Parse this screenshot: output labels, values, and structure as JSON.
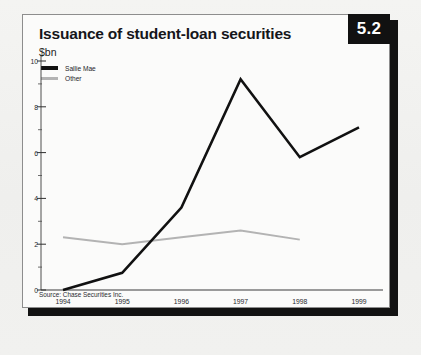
{
  "figure": {
    "badge": "5.2",
    "title": "Issuance of student-loan securities",
    "unit": "$bn",
    "source": "Source: Chase Securities Inc."
  },
  "colors": {
    "sallie_mae": "#111111",
    "other": "#b3b3b3",
    "badge_bg": "#111111",
    "badge_text": "#ffffff",
    "panel_bg": "#fbfbfa",
    "page_bg": "#f2f2f0",
    "axis": "#3a3a3a"
  },
  "legend": {
    "items": [
      {
        "label": "Sallie Mae",
        "color": "#111111"
      },
      {
        "label": "Other",
        "color": "#b3b3b3"
      }
    ]
  },
  "chart_data": {
    "type": "line",
    "title": "Issuance of student-loan securities",
    "subtitle": "$bn",
    "xlabel": "",
    "ylabel": "$bn",
    "categories": [
      "1994",
      "1995",
      "1996",
      "1997",
      "1998",
      "1999"
    ],
    "series": [
      {
        "name": "Sallie Mae",
        "color": "#111111",
        "values": [
          0.0,
          0.75,
          3.6,
          9.2,
          5.8,
          7.1
        ]
      },
      {
        "name": "Other",
        "color": "#b3b3b3",
        "values": [
          2.3,
          2.0,
          2.3,
          2.6,
          2.2,
          null
        ]
      }
    ],
    "ylim": [
      0,
      10
    ],
    "yticks": [
      0,
      2,
      4,
      6,
      8,
      10
    ],
    "yticklabels": [
      "0",
      "2",
      "4",
      "6",
      "8",
      "10"
    ],
    "yminorticks": [
      1,
      3,
      5,
      7,
      9
    ],
    "grid": false,
    "legend_position": "top-left"
  }
}
